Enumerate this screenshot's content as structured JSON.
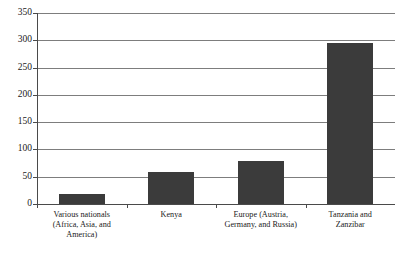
{
  "chart_data": {
    "type": "bar",
    "title": "",
    "xlabel": "",
    "ylabel": "",
    "ylim": [
      0,
      350
    ],
    "ytick_step": 50,
    "yticks": [
      0,
      50,
      100,
      150,
      200,
      250,
      300,
      350
    ],
    "ytick_labels": [
      "0",
      "50",
      "100",
      "150",
      "200",
      "250",
      "300",
      "350"
    ],
    "grid": true,
    "legend": "none",
    "bar_color": "#3b3b3b",
    "axis_color": "#4a4a4a",
    "gridline_color": "#7d7d7d",
    "categories": [
      "Various nationals (Africa, Asia, and America)",
      "Kenya",
      "Europe (Austria, Germany, and Russia)",
      "Tanzania and Zanzibar"
    ],
    "category_label_lines": [
      [
        "Various nationals",
        "(Africa, Asia, and",
        "America)"
      ],
      [
        "Kenya"
      ],
      [
        "Europe (Austria,",
        "Germany, and Russia)"
      ],
      [
        "Tanzania and",
        "Zanzibar"
      ]
    ],
    "values": [
      18,
      59,
      79,
      295
    ],
    "bars": [
      {
        "category": "Various nationals (Africa, Asia, and America)",
        "value": 18
      },
      {
        "category": "Kenya",
        "value": 59
      },
      {
        "category": "Europe (Austria, Germany, and Russia)",
        "value": 79
      },
      {
        "category": "Tanzania and Zanzibar",
        "value": 295
      }
    ]
  },
  "caption": ""
}
